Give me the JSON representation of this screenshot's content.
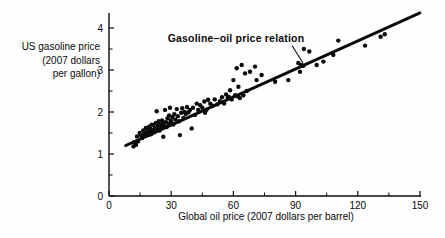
{
  "figure": {
    "background": "#fefefe",
    "ink_color": "#0a0a0a"
  },
  "chart_data": {
    "type": "scatter",
    "title": "",
    "xlabel": "Global oil price (2007 dollars per barrel)",
    "ylabel_lines": [
      "US gasoline price",
      "(2007 dollars",
      "per gallon)"
    ],
    "annotation": {
      "text": "Gasoline–oil price relation"
    },
    "xlim": [
      0,
      150
    ],
    "ylim": [
      0,
      4.36
    ],
    "x_major_ticks": [
      0,
      30,
      60,
      90,
      120,
      150
    ],
    "x_minor_ticks": [
      15,
      45,
      75,
      105,
      135
    ],
    "y_major_ticks": [
      0,
      1,
      2,
      3,
      4
    ],
    "y_minor_ticks": [
      0.5,
      1.5,
      2.5,
      3.5
    ],
    "grid": false,
    "legend": "none",
    "trendline": {
      "x1": 8,
      "y1": 1.2,
      "x2": 150,
      "y2": 4.36
    },
    "points": [
      [
        11.8,
        1.18
      ],
      [
        12.1,
        1.28
      ],
      [
        13,
        1.22
      ],
      [
        13.5,
        1.42
      ],
      [
        14,
        1.3
      ],
      [
        14.8,
        1.5
      ],
      [
        15.5,
        1.44
      ],
      [
        16,
        1.38
      ],
      [
        16.5,
        1.56
      ],
      [
        17,
        1.5
      ],
      [
        17.5,
        1.44
      ],
      [
        17.8,
        1.62
      ],
      [
        18.2,
        1.5
      ],
      [
        18.6,
        1.58
      ],
      [
        19,
        1.45
      ],
      [
        19.3,
        1.65
      ],
      [
        19.7,
        1.52
      ],
      [
        20,
        1.6
      ],
      [
        20.3,
        1.47
      ],
      [
        20.6,
        1.7
      ],
      [
        21,
        1.56
      ],
      [
        21.4,
        1.69
      ],
      [
        21.8,
        1.52
      ],
      [
        22.2,
        1.62
      ],
      [
        22.6,
        1.74
      ],
      [
        23,
        2.02
      ],
      [
        23.3,
        1.6
      ],
      [
        23.7,
        1.68
      ],
      [
        24,
        1.78
      ],
      [
        24.4,
        1.56
      ],
      [
        24.8,
        1.7
      ],
      [
        25.2,
        1.62
      ],
      [
        25.6,
        1.8
      ],
      [
        26,
        1.72
      ],
      [
        26.2,
        1.41
      ],
      [
        26.6,
        1.66
      ],
      [
        27,
        2.05
      ],
      [
        27.4,
        1.76
      ],
      [
        27.8,
        1.64
      ],
      [
        28.2,
        1.85
      ],
      [
        28.6,
        1.72
      ],
      [
        29,
        1.92
      ],
      [
        29.4,
        2.1
      ],
      [
        29.8,
        1.8
      ],
      [
        30.2,
        1.74
      ],
      [
        30.6,
        1.88
      ],
      [
        31,
        1.7
      ],
      [
        31.5,
        1.95
      ],
      [
        32,
        1.82
      ],
      [
        32.7,
        2.07
      ],
      [
        33.2,
        1.9
      ],
      [
        33.8,
        1.78
      ],
      [
        34.2,
        1.45
      ],
      [
        34.8,
        1.98
      ],
      [
        35.3,
        2.09
      ],
      [
        35.9,
        1.86
      ],
      [
        36.5,
        2.0
      ],
      [
        37,
        1.95
      ],
      [
        37.6,
        2.12
      ],
      [
        38.3,
        1.99
      ],
      [
        39,
        2.05
      ],
      [
        39.9,
        1.61
      ],
      [
        40.5,
        2.1
      ],
      [
        41.5,
        1.93
      ],
      [
        42.3,
        2.2
      ],
      [
        43,
        2.05
      ],
      [
        44,
        2.16
      ],
      [
        45,
        2.1
      ],
      [
        46,
        2.25
      ],
      [
        46.3,
        1.98
      ],
      [
        47,
        2.05
      ],
      [
        47.8,
        2.29
      ],
      [
        48.8,
        2.2
      ],
      [
        50,
        2.15
      ],
      [
        51,
        2.3
      ],
      [
        52.2,
        2.18
      ],
      [
        53.5,
        2.26
      ],
      [
        54.5,
        2.35
      ],
      [
        55.5,
        2.2
      ],
      [
        56.5,
        2.42
      ],
      [
        57.3,
        2.34
      ],
      [
        57.8,
        2.36
      ],
      [
        58.4,
        2.52
      ],
      [
        59.2,
        2.3
      ],
      [
        60,
        2.76
      ],
      [
        60.8,
        2.4
      ],
      [
        61.6,
        3.04
      ],
      [
        62.2,
        2.37
      ],
      [
        62.4,
        2.6
      ],
      [
        63.2,
        2.33
      ],
      [
        64,
        3.12
      ],
      [
        64.8,
        2.4
      ],
      [
        65.6,
        2.92
      ],
      [
        66.5,
        2.5
      ],
      [
        68,
        2.96
      ],
      [
        70.4,
        3.08
      ],
      [
        71.2,
        2.76
      ],
      [
        73.6,
        2.88
      ],
      [
        80.1,
        2.72
      ],
      [
        86.5,
        2.76
      ],
      [
        91.3,
        3.17
      ],
      [
        92.6,
        3.12
      ],
      [
        93.7,
        3.1
      ],
      [
        92.1,
        2.96
      ],
      [
        94,
        3.5
      ],
      [
        96.6,
        3.44
      ],
      [
        100.2,
        3.12
      ],
      [
        103.4,
        3.2
      ],
      [
        108.2,
        3.36
      ],
      [
        110.6,
        3.7
      ],
      [
        123.5,
        3.58
      ],
      [
        131,
        3.79
      ],
      [
        133,
        3.85
      ]
    ]
  }
}
